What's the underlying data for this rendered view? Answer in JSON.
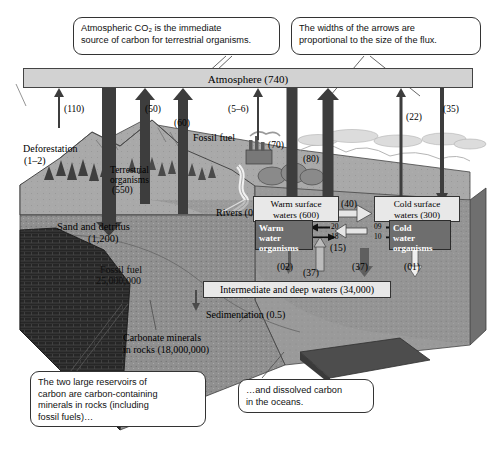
{
  "figure": {
    "units_note": "Reservoirs in parentheses; fluxes as arrow labels"
  },
  "callouts": [
    {
      "id": "callout-co2",
      "line1": "Atmospheric CO₂ is the immediate",
      "line2": "source of carbon for terrestrial organisms."
    },
    {
      "id": "callout-arrow-widths",
      "line1": "The widths of the arrows are",
      "line2": "proportional to the size of the flux."
    },
    {
      "id": "callout-reservoirs",
      "line1": "The two large reservoirs of",
      "line2": "carbon are carbon-containing",
      "line3": "minerals in rocks (including",
      "line4": "fossil fuels)…"
    },
    {
      "id": "callout-dissolved",
      "line1": "…and dissolved carbon",
      "line2": "in the oceans."
    }
  ],
  "atmosphere": {
    "label": "Atmosphere (740)"
  },
  "land_labels": {
    "deforestation": "Deforestation",
    "deforestation_value": "(1–2)",
    "terrestrial_organisms_l1": "Terrestrial",
    "terrestrial_organisms_l2": "organisms",
    "terrestrial_organisms_l3": "(550)",
    "fossil_fuel_surface": "Fossil fuel",
    "rivers": "Rivers (0.5)",
    "sand_detritus_l1": "Sand and detritus",
    "sand_detritus_l2": "(1,200)",
    "fossil_fuel_l1": "Fossil fuel",
    "fossil_fuel_l2": "25,000,000",
    "carbonate_l1": "Carbonate minerals",
    "carbonate_l2": "in rocks (18,000,000)",
    "sedimentation": "Sedimentation (0.5)"
  },
  "ocean_boxes": {
    "warm_surface": "Warm surface waters (600)",
    "warm_surface_l1": "Warm surface",
    "warm_surface_l2": "waters (600)",
    "cold_surface_l1": "Cold surface",
    "cold_surface_l2": "waters (300)",
    "warm_org_l1": "Warm",
    "warm_org_l2": "water",
    "warm_org_l3": "organisms",
    "cold_org_l1": "Cold",
    "cold_org_l2": "water",
    "cold_org_l3": "organisms",
    "deep_waters": "Intermediate and deep waters (34,000)"
  },
  "fluxes": {
    "respiration_land": "(110)",
    "photosynthesis_land": "(50)",
    "decomposition": "(60)",
    "fossil_fuel_burning": "(5–6)",
    "ocean_outgas_warm": "(70)",
    "ocean_uptake_warm": "(80)",
    "cold_outgas": "(22)",
    "cold_uptake": "(35)",
    "warm_to_cold": "(40)",
    "warm_to_deep_org": "(02)",
    "deep_to_warm": "(37)",
    "cold_downwell": "(15)",
    "deep_upwell": "(37)",
    "cold_org_to_deep": "(01)",
    "warm_org_in": "20",
    "warm_org_out": "18",
    "cold_org_in": "09",
    "cold_org_out": "10"
  },
  "colors": {
    "atmosphere_fill": "#d2d2d2",
    "arrow_dark": "#3d3d3d",
    "arrow_light": "#b9b9b9",
    "box_fill": "#e8e8e8",
    "organism_fill": "#6e6e6e",
    "ocean_deep": "#8f8f8f",
    "ocean_surface": "#c0c0c0",
    "land": "#a8a8a8",
    "rock_dark": "#2a2a2a"
  }
}
